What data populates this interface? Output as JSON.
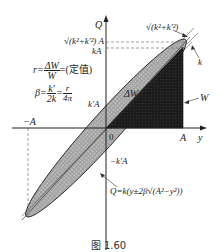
{
  "figure": {
    "caption": "图 1.60",
    "axes": {
      "vertical_label": "Q",
      "horizontal_label": "y",
      "origin_label": "0",
      "x_pos_label": "A",
      "x_neg_label": "−A"
    },
    "q_labels": {
      "top": "√(k²+k′²) A",
      "kA": "kA",
      "kprimeA": "k′A",
      "neg_kprimeA": "−k′A"
    },
    "region_labels": {
      "delta_w": "ΔW",
      "w": "W"
    },
    "slope_labels": {
      "major_axis_slope": "√(k²+k′²)",
      "line_slope": "k"
    },
    "equations": {
      "r_lhs": "r=",
      "r_num": "ΔW",
      "r_den": "W",
      "r_rhs": "=(定值)",
      "beta_lhs": "β=",
      "beta_num1": "k′",
      "beta_den1": "2k",
      "beta_eq": "=",
      "beta_num2": "r",
      "beta_den2": "4π",
      "q_formula": "Q=k(y±2β√(A²−y²))"
    },
    "colors": {
      "ellipse_fill": "#a9a9a9",
      "triangle_fill": "#1e1e1e",
      "axis": "#222222",
      "dashed": "#777777"
    }
  }
}
